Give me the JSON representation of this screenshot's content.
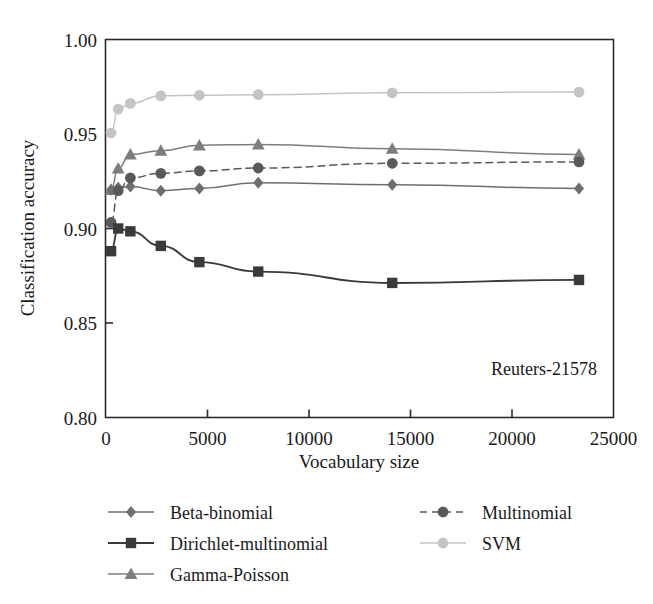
{
  "chart_data": {
    "type": "line",
    "title": "",
    "xlabel": "Vocabulary size",
    "ylabel": "Classification accuracy",
    "annotation": "Reuters-21578",
    "xlim": [
      0,
      25000
    ],
    "ylim": [
      0.8,
      1.0
    ],
    "xticks": [
      0,
      5000,
      10000,
      15000,
      20000,
      25000
    ],
    "xtick_labels": [
      "0",
      "5000",
      "10000",
      "15000",
      "20000",
      "25000"
    ],
    "yticks": [
      0.8,
      0.85,
      0.9,
      0.95,
      1.0
    ],
    "ytick_labels": [
      "0.80",
      "0.85",
      "0.90",
      "0.95",
      "1.00"
    ],
    "grid": false,
    "legend_position": "below-plot",
    "x": [
      250,
      600,
      1200,
      2700,
      4600,
      7500,
      14100,
      23300
    ],
    "series": [
      {
        "name": "Beta-binomial",
        "marker": "diamond",
        "linestyle": "solid",
        "color": "#6e6e6e",
        "values": [
          0.9205,
          0.9215,
          0.9222,
          0.92,
          0.9212,
          0.9242,
          0.9232,
          0.9212
        ]
      },
      {
        "name": "Dirichlet-multinomial",
        "marker": "square",
        "linestyle": "solid",
        "color": "#3a3a3a",
        "values": [
          0.888,
          0.9,
          0.8985,
          0.8908,
          0.8822,
          0.8772,
          0.8712,
          0.8728
        ]
      },
      {
        "name": "Gamma-Poisson",
        "marker": "triangle",
        "linestyle": "solid",
        "color": "#7d7d7d",
        "values": [
          0.9205,
          0.9318,
          0.9392,
          0.9412,
          0.944,
          0.9445,
          0.9422,
          0.9392
        ]
      },
      {
        "name": "Multinomial",
        "marker": "circle",
        "linestyle": "dashed",
        "color": "#595959",
        "values": [
          0.9032,
          0.92,
          0.9268,
          0.9292,
          0.9305,
          0.932,
          0.9345,
          0.9352
        ]
      },
      {
        "name": "SVM",
        "marker": "circle",
        "linestyle": "solid",
        "color": "#c4c4c4",
        "values": [
          0.9505,
          0.9632,
          0.9662,
          0.9702,
          0.9705,
          0.9708,
          0.9718,
          0.9722
        ]
      }
    ]
  },
  "legend": {
    "entries": [
      {
        "label": "Beta-binomial",
        "marker": "diamond-icon",
        "color": "#6e6e6e",
        "dashed": false
      },
      {
        "label": "Dirichlet-multinomial",
        "marker": "square-icon",
        "color": "#3a3a3a",
        "dashed": false
      },
      {
        "label": "Gamma-Poisson",
        "marker": "triangle-icon",
        "color": "#7d7d7d",
        "dashed": false
      },
      {
        "label": "Multinomial",
        "marker": "circle-icon",
        "color": "#595959",
        "dashed": true
      },
      {
        "label": "SVM",
        "marker": "circle-icon",
        "color": "#c4c4c4",
        "dashed": false
      }
    ]
  }
}
